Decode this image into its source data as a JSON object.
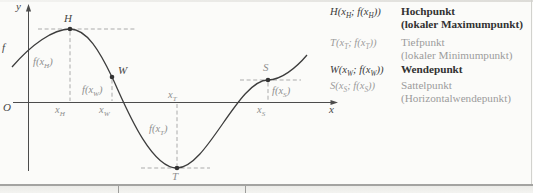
{
  "figure": {
    "background": "#fbfbf9",
    "curve_color": "#3d3d3d",
    "axis_color": "#4c4c4c",
    "dash_color": "#ababab",
    "dark_text": "#3a3a3a",
    "gray_text": "#9c9c9c"
  },
  "graph": {
    "axis": {
      "y_label": "y",
      "x_label": "x",
      "origin_label": "O",
      "function_label": "f"
    },
    "points": [
      {
        "id": "H",
        "label": "H",
        "kind": "Hochpunkt",
        "x_label": "x_H",
        "value_label": "f(x_H)"
      },
      {
        "id": "W",
        "label": "W",
        "kind": "Wendepunkt",
        "x_label": "x_W",
        "value_label": "f(x_W)"
      },
      {
        "id": "T",
        "label": "T",
        "kind": "Tiefpunkt",
        "x_label": "x_T",
        "value_label": "f(x_T)"
      },
      {
        "id": "S",
        "label": "S",
        "kind": "Sattelpunkt",
        "x_label": "x_S",
        "value_label": "f(x_S)"
      }
    ]
  },
  "legend": {
    "rows": [
      {
        "formula": "H(x_H; f(x_H))",
        "name": "Hochpunkt",
        "subname": "(lokaler Maximumpunkt)",
        "emphasis": true
      },
      {
        "formula": "T(x_T; f(x_T))",
        "name": "Tiefpunkt",
        "subname": "(lokaler Minimumpunkt)",
        "emphasis": false
      },
      {
        "formula": "W(x_W; f(x_W))",
        "name": "Wendepunkt",
        "subname": "",
        "emphasis": true
      },
      {
        "formula": "S(x_S; f(x_S))",
        "name": "Sattelpunkt",
        "subname": "(Horizontalwendepunkt)",
        "emphasis": false
      }
    ]
  }
}
